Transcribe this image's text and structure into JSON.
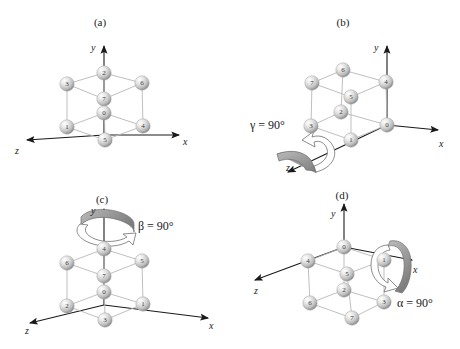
{
  "figure": {
    "width": 460,
    "height": 349,
    "background": "#ffffff"
  },
  "colors": {
    "axis": "#1a1a1a",
    "edge": "#b6b6b6",
    "sphere_light": "#ffffff",
    "sphere_mid": "#cfcfcf",
    "sphere_dark": "#8f8f8f",
    "label": "#1a1a1a",
    "ribbon": "#9a9a9a",
    "ribbon_outline": "#6e6e6e"
  },
  "panels": [
    {
      "id": "a",
      "caption": "(a)",
      "axes": [
        {
          "name": "y",
          "label": "y"
        },
        {
          "name": "x",
          "label": "x"
        },
        {
          "name": "z",
          "label": "z"
        }
      ],
      "rotation": null,
      "nodes": [
        {
          "label": "2",
          "position": "top-back"
        },
        {
          "label": "3",
          "position": "top-left"
        },
        {
          "label": "6",
          "position": "top-right"
        },
        {
          "label": "7",
          "position": "top-front"
        },
        {
          "label": "0",
          "position": "bottom-back"
        },
        {
          "label": "1",
          "position": "bottom-left"
        },
        {
          "label": "4",
          "position": "bottom-right"
        },
        {
          "label": "5",
          "position": "bottom-front"
        }
      ]
    },
    {
      "id": "b",
      "caption": "(b)",
      "axes": [
        {
          "name": "y",
          "label": "y"
        },
        {
          "name": "x",
          "label": "x"
        },
        {
          "name": "z",
          "label": "z"
        }
      ],
      "rotation": {
        "symbol": "γ",
        "equals": "=",
        "value": "90°",
        "text": "γ = 90°",
        "axis": "z"
      },
      "nodes": [
        {
          "label": "6",
          "position": "top-back"
        },
        {
          "label": "7",
          "position": "top-left"
        },
        {
          "label": "4",
          "position": "top-right"
        },
        {
          "label": "5",
          "position": "top-front"
        },
        {
          "label": "2",
          "position": "bottom-back"
        },
        {
          "label": "3",
          "position": "bottom-left"
        },
        {
          "label": "0",
          "position": "bottom-right"
        },
        {
          "label": "1",
          "position": "bottom-front"
        }
      ]
    },
    {
      "id": "c",
      "caption": "(c)",
      "axes": [
        {
          "name": "y",
          "label": "y"
        },
        {
          "name": "x",
          "label": "x"
        },
        {
          "name": "z",
          "label": "z"
        }
      ],
      "rotation": {
        "symbol": "β",
        "equals": "=",
        "value": "90°",
        "text": "β = 90°",
        "axis": "y"
      },
      "nodes": [
        {
          "label": "4",
          "position": "top-back"
        },
        {
          "label": "6",
          "position": "top-left"
        },
        {
          "label": "5",
          "position": "top-right"
        },
        {
          "label": "7",
          "position": "top-front"
        },
        {
          "label": "0",
          "position": "bottom-back"
        },
        {
          "label": "2",
          "position": "bottom-left"
        },
        {
          "label": "1",
          "position": "bottom-right"
        },
        {
          "label": "3",
          "position": "bottom-front"
        }
      ]
    },
    {
      "id": "d",
      "caption": "(d)",
      "axes": [
        {
          "name": "y",
          "label": "y"
        },
        {
          "name": "x",
          "label": "x"
        },
        {
          "name": "z",
          "label": "z"
        }
      ],
      "rotation": {
        "symbol": "α",
        "equals": "=",
        "value": "90°",
        "text": "α = 90°",
        "axis": "x"
      },
      "nodes": [
        {
          "label": "0",
          "position": "top-back"
        },
        {
          "label": "4",
          "position": "top-left"
        },
        {
          "label": "1",
          "position": "top-right"
        },
        {
          "label": "5",
          "position": "top-front"
        },
        {
          "label": "2",
          "position": "bottom-back"
        },
        {
          "label": "6",
          "position": "bottom-left"
        },
        {
          "label": "3",
          "position": "bottom-right"
        },
        {
          "label": "7",
          "position": "bottom-front"
        }
      ]
    }
  ]
}
